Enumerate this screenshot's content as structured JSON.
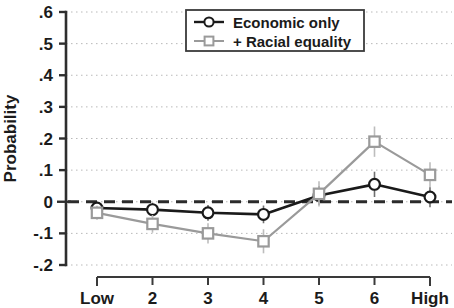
{
  "chart_data": {
    "type": "line",
    "title": "",
    "subtitle": "",
    "xlabel": "",
    "ylabel": "Probability",
    "categories": [
      "Low",
      "2",
      "3",
      "4",
      "5",
      "6",
      "High"
    ],
    "x": [
      1,
      2,
      3,
      4,
      5,
      6,
      7
    ],
    "ylim": [
      -0.2,
      0.6
    ],
    "xlim": [
      0.6,
      7.4
    ],
    "yticks": [
      0.6,
      0.5,
      0.4,
      0.3,
      0.2,
      0.1,
      0,
      -0.1,
      -0.2
    ],
    "ytick_labels": [
      ".6",
      ".5",
      ".4",
      ".3",
      ".2",
      ".1",
      "0",
      "-.1",
      "-.2"
    ],
    "grid": "horizontal-dotted",
    "legend_position": "top-center",
    "reference_line": {
      "y": 0,
      "style": "dashed",
      "color": "#2b2b2b"
    },
    "error_bars": true,
    "series": [
      {
        "name": "Economic only",
        "marker": "circle",
        "color": "#1a1a1a",
        "values": [
          -0.02,
          -0.025,
          -0.035,
          -0.04,
          0.02,
          0.055,
          0.015
        ],
        "errors": [
          0.018,
          0.022,
          0.025,
          0.028,
          0.03,
          0.04,
          0.032
        ]
      },
      {
        "name": "+ Racial equality",
        "marker": "square",
        "color": "#9a9a9a",
        "values": [
          -0.035,
          -0.07,
          -0.1,
          -0.125,
          0.025,
          0.19,
          0.085
        ],
        "errors": [
          0.022,
          0.028,
          0.032,
          0.038,
          0.04,
          0.048,
          0.04
        ]
      }
    ],
    "legend": [
      {
        "label": "Economic only",
        "marker": "circle",
        "color": "#1a1a1a"
      },
      {
        "label": "+ Racial equality",
        "marker": "square",
        "color": "#9a9a9a"
      }
    ]
  }
}
